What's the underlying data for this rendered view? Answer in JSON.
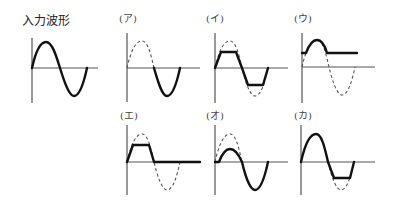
{
  "title": "入力波形",
  "panels": [
    {
      "id": "input",
      "label": "入力波形",
      "description": "full sine wave (input)",
      "x": 32,
      "y": 68,
      "dashed": "",
      "solid": "full"
    },
    {
      "id": "a",
      "label": "(ア)",
      "description": "positive half removed; only negative half remains",
      "x": 127,
      "y": 68
    },
    {
      "id": "i",
      "label": "(イ)",
      "description": "sine clipped symmetrically at top and bottom",
      "x": 215,
      "y": 68
    },
    {
      "id": "u",
      "label": "(ウ)",
      "description": "output held at positive level with hump; negative half removed",
      "x": 302,
      "y": 67
    },
    {
      "id": "e",
      "label": "(エ)",
      "description": "positive half clipped at top; negative half removed",
      "x": 127,
      "y": 162
    },
    {
      "id": "o",
      "label": "(オ)",
      "description": "positive half attenuated; negative half full",
      "x": 215,
      "y": 162
    },
    {
      "id": "ka",
      "label": "(カ)",
      "description": "positive half full; negative half clipped",
      "x": 301,
      "y": 162
    }
  ],
  "colors": {
    "solid": "#111111",
    "dashed": "#555555",
    "axis": "#555555"
  }
}
